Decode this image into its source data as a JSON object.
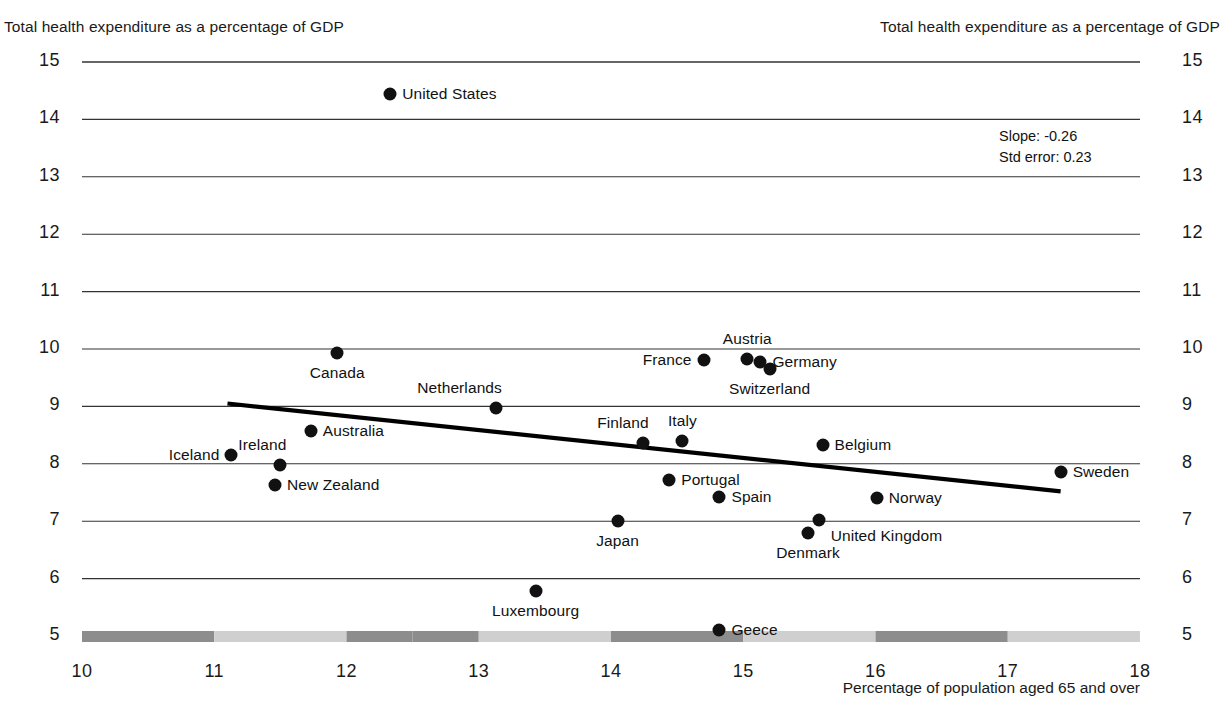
{
  "captions": {
    "left_axis_title": "Total health expenditure as a percentage of GDP",
    "right_axis_title": "Total health expenditure as a percentage of GDP",
    "xaxis_title": "Percentage of population aged 65 and over"
  },
  "annotation": {
    "slope_line": "Slope: -0.26",
    "std_error_line": "Std error: 0.23"
  },
  "chart_data": {
    "type": "scatter",
    "title": "",
    "xlabel": "Percentage of population aged 65 and over",
    "ylabel": "Total health expenditure as a percentage of GDP",
    "xlim": [
      10,
      18
    ],
    "ylim": [
      5,
      15
    ],
    "xticks": [
      "10",
      "11",
      "12",
      "13",
      "14",
      "15",
      "16",
      "17",
      "18"
    ],
    "yticks": [
      "5",
      "6",
      "7",
      "8",
      "9",
      "10",
      "11",
      "12",
      "13",
      "14",
      "15"
    ],
    "grid": "horizontal",
    "legend": "none",
    "annotations": {
      "slope": -0.26,
      "std_error": 0.23
    },
    "trendline": {
      "x_start": 11.1,
      "y_start": 9.05,
      "x_end": 17.4,
      "y_end": 7.52
    },
    "points": [
      {
        "name": "United States",
        "x": 12.33,
        "y": 14.45,
        "label_pos": "r"
      },
      {
        "name": "Canada",
        "x": 11.93,
        "y": 9.93,
        "label_pos": "below"
      },
      {
        "name": "Austria",
        "x": 15.03,
        "y": 9.82,
        "label_pos": "above"
      },
      {
        "name": "France",
        "x": 14.7,
        "y": 9.81,
        "label_pos": "l"
      },
      {
        "name": "Germany",
        "x": 15.13,
        "y": 9.78,
        "label_pos": "r"
      },
      {
        "name": "Switzerland",
        "x": 15.2,
        "y": 9.65,
        "label_pos": "below"
      },
      {
        "name": "Netherlands",
        "x": 13.13,
        "y": 8.97,
        "label_pos": "above-left"
      },
      {
        "name": "Australia",
        "x": 11.73,
        "y": 8.57,
        "label_pos": "r"
      },
      {
        "name": "Italy",
        "x": 14.54,
        "y": 8.4,
        "label_pos": "above"
      },
      {
        "name": "Finland",
        "x": 14.24,
        "y": 8.37,
        "label_pos": "above-left"
      },
      {
        "name": "Belgium",
        "x": 15.6,
        "y": 8.33,
        "label_pos": "r"
      },
      {
        "name": "Iceland",
        "x": 11.13,
        "y": 8.15,
        "label_pos": "l"
      },
      {
        "name": "Ireland",
        "x": 11.5,
        "y": 7.98,
        "label_pos": "above-left"
      },
      {
        "name": "Sweden",
        "x": 17.4,
        "y": 7.86,
        "label_pos": "r"
      },
      {
        "name": "Portugal",
        "x": 14.44,
        "y": 7.72,
        "label_pos": "r"
      },
      {
        "name": "New Zealand",
        "x": 11.46,
        "y": 7.63,
        "label_pos": "r"
      },
      {
        "name": "Spain",
        "x": 14.82,
        "y": 7.43,
        "label_pos": "r"
      },
      {
        "name": "Norway",
        "x": 16.01,
        "y": 7.4,
        "label_pos": "r"
      },
      {
        "name": "United Kingdom",
        "x": 15.57,
        "y": 7.02,
        "label_pos": "below-right"
      },
      {
        "name": "Japan",
        "x": 14.05,
        "y": 7.0,
        "label_pos": "below"
      },
      {
        "name": "Denmark",
        "x": 15.49,
        "y": 6.8,
        "label_pos": "below"
      },
      {
        "name": "Luxembourg",
        "x": 13.43,
        "y": 5.78,
        "label_pos": "below"
      },
      {
        "name": "Geece",
        "x": 14.82,
        "y": 5.1,
        "label_pos": "r"
      }
    ]
  },
  "xaxis_bands": [
    {
      "from": 10,
      "to": 11,
      "shade": "dark"
    },
    {
      "from": 11,
      "to": 12,
      "shade": "light"
    },
    {
      "from": 12,
      "to": 12.5,
      "shade": "dark"
    },
    {
      "from": 12.5,
      "to": 13,
      "shade": "dark"
    },
    {
      "from": 13,
      "to": 14,
      "shade": "light"
    },
    {
      "from": 14,
      "to": 15,
      "shade": "dark"
    },
    {
      "from": 15,
      "to": 16,
      "shade": "light"
    },
    {
      "from": 16,
      "to": 17,
      "shade": "dark"
    },
    {
      "from": 17,
      "to": 18,
      "shade": "light"
    }
  ],
  "colors": {
    "point": "#111111",
    "gridline": "#333333",
    "trendline": "#000000",
    "band_dark": "#8d8d8d",
    "band_light": "#cfcfcf",
    "text": "#111111"
  }
}
